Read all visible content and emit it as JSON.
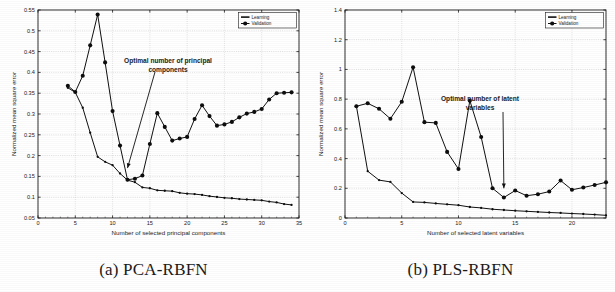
{
  "figure": {
    "panels": [
      {
        "caption": "(a) PCA-RBFN",
        "annotation": "Optimal number of principal\ncomponents",
        "annotation_line1": "Optimal number of principal",
        "annotation_line2": "components"
      },
      {
        "caption": "(b) PLS-RBFN",
        "annotation": "Optimal number of latent\nvariables",
        "annotation_line1": "Optimal number of latent",
        "annotation_line2": "variables"
      }
    ]
  },
  "legend": {
    "learning": "Learning",
    "validation": "Validation"
  },
  "chart_data": [
    {
      "type": "line",
      "title": "",
      "panel": "(a) PCA-RBFN",
      "xlabel": "Number of selected principal components",
      "ylabel": "Normalized mean square error",
      "xlim": [
        0,
        35
      ],
      "ylim": [
        0.05,
        0.55
      ],
      "xticks": [
        0,
        5,
        10,
        15,
        20,
        25,
        30,
        35
      ],
      "xtick_labels": [
        "0",
        "5",
        "10",
        "15",
        "20",
        "25",
        "30",
        "35"
      ],
      "yticks": [
        0.05,
        0.1,
        0.15,
        0.2,
        0.25,
        0.3,
        0.35,
        0.4,
        0.45,
        0.5,
        0.55
      ],
      "ytick_labels": [
        "0.05",
        "0.1",
        "0.15",
        "0.2",
        "0.25",
        "0.3",
        "0.35",
        "0.4",
        "0.45",
        "0.5",
        "0.55"
      ],
      "grid": true,
      "legend_position": "top-right",
      "annotation": {
        "text_line1": "Optimal number of principal",
        "text_line2": "components",
        "points_to_x": 12,
        "points_to_y": 0.17
      },
      "x": [
        4,
        5,
        6,
        7,
        8,
        9,
        10,
        11,
        12,
        13,
        14,
        15,
        16,
        17,
        18,
        19,
        20,
        21,
        22,
        23,
        24,
        25,
        26,
        27,
        28,
        29,
        30,
        31,
        32,
        33,
        34
      ],
      "series": [
        {
          "name": "Learning",
          "x": [
            4,
            5,
            6,
            7,
            8,
            9,
            10,
            11,
            12,
            13,
            14,
            15,
            16,
            17,
            18,
            19,
            20,
            21,
            22,
            23,
            24,
            25,
            26,
            27,
            28,
            29,
            30,
            31,
            32,
            33,
            34
          ],
          "values": [
            0.363,
            0.352,
            0.315,
            0.255,
            0.197,
            0.185,
            0.177,
            0.157,
            0.141,
            0.136,
            0.1235,
            0.1215,
            0.1165,
            0.1155,
            0.1145,
            0.1105,
            0.1085,
            0.1075,
            0.1055,
            0.1025,
            0.1005,
            0.0985,
            0.0975,
            0.0955,
            0.0945,
            0.0935,
            0.0925,
            0.0895,
            0.0875,
            0.0835,
            0.0815
          ],
          "markers": true
        },
        {
          "name": "Validation",
          "x": [
            4,
            5,
            6,
            7,
            8,
            9,
            10,
            11,
            12,
            13,
            14,
            15,
            16,
            17,
            18,
            19,
            20,
            21,
            22,
            23,
            24,
            25,
            26,
            27,
            28,
            29,
            30,
            31,
            32,
            33,
            34
          ],
          "values": [
            0.368,
            0.353,
            0.392,
            0.465,
            0.539,
            0.424,
            0.307,
            0.224,
            0.142,
            0.1445,
            0.152,
            0.228,
            0.302,
            0.269,
            0.236,
            0.241,
            0.245,
            0.288,
            0.321,
            0.295,
            0.272,
            0.275,
            0.281,
            0.292,
            0.301,
            0.305,
            0.312,
            0.335,
            0.35,
            0.351,
            0.352
          ],
          "markers": true
        }
      ]
    },
    {
      "type": "line",
      "title": "",
      "panel": "(b) PLS-RBFN",
      "xlabel": "Number of selected latent variables",
      "ylabel": "Normalized mean square error",
      "xlim": [
        0,
        23
      ],
      "ylim": [
        0,
        1.4
      ],
      "xticks": [
        0,
        5,
        10,
        15,
        20
      ],
      "xtick_labels": [
        "0",
        "5",
        "10",
        "15",
        "20"
      ],
      "yticks": [
        0,
        0.2,
        0.4,
        0.6,
        0.8,
        1.0,
        1.2,
        1.4
      ],
      "ytick_labels": [
        "0",
        "0.2",
        "0.4",
        "0.6",
        "0.8",
        "1",
        "1.2",
        "1.4"
      ],
      "grid": true,
      "legend_position": "top-right",
      "annotation": {
        "text_line1": "Optimal number of latent",
        "text_line2": "variables",
        "points_to_x": 14,
        "points_to_y": 0.2
      },
      "x": [
        1,
        2,
        3,
        4,
        5,
        6,
        7,
        8,
        9,
        10,
        11,
        12,
        13,
        14,
        15,
        16,
        17,
        18,
        19,
        20,
        21,
        22,
        23
      ],
      "series": [
        {
          "name": "Learning",
          "x": [
            1,
            2,
            3,
            4,
            5,
            6,
            7,
            8,
            9,
            10,
            11,
            12,
            13,
            14,
            15,
            16,
            17,
            18,
            19,
            20,
            21,
            22,
            23
          ],
          "values": [
            0.755,
            0.315,
            0.255,
            0.243,
            0.168,
            0.108,
            0.105,
            0.098,
            0.092,
            0.086,
            0.074,
            0.068,
            0.059,
            0.054,
            0.049,
            0.045,
            0.041,
            0.037,
            0.034,
            0.03,
            0.027,
            0.023,
            0.018
          ],
          "markers": true
        },
        {
          "name": "Validation",
          "x": [
            1,
            2,
            3,
            4,
            5,
            6,
            7,
            8,
            9,
            10,
            11,
            12,
            13,
            14,
            15,
            16,
            17,
            18,
            19,
            20,
            21,
            22,
            23
          ],
          "values": [
            0.752,
            0.772,
            0.735,
            0.668,
            0.782,
            1.015,
            0.645,
            0.64,
            0.445,
            0.33,
            0.79,
            0.545,
            0.2,
            0.138,
            0.185,
            0.15,
            0.16,
            0.178,
            0.252,
            0.19,
            0.205,
            0.222,
            0.24
          ],
          "markers": true
        }
      ]
    }
  ]
}
